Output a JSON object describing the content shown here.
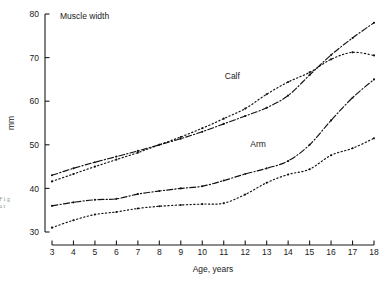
{
  "figure": {
    "title": "Muscle width",
    "ylabel": "mm",
    "xlabel": "Age, years",
    "series_labels": {
      "calf": "Calf",
      "arm": "Arm"
    },
    "margin_note": "F i g u r"
  },
  "chart_data": {
    "type": "line",
    "title": "Muscle width",
    "xlabel": "Age, years",
    "ylabel": "mm",
    "xlim": [
      3,
      18
    ],
    "ylim": [
      30,
      80
    ],
    "xticks": [
      3,
      4,
      5,
      6,
      7,
      8,
      9,
      10,
      11,
      12,
      13,
      14,
      15,
      16,
      17,
      18
    ],
    "yticks": [
      30,
      40,
      50,
      60,
      70,
      80
    ],
    "xtick_labels": [
      "3",
      "4",
      "5",
      "6",
      "7",
      "8",
      "9",
      "10",
      "11",
      "12",
      "13",
      "14",
      "15",
      "16",
      "17",
      "18"
    ],
    "ytick_labels": [
      "30",
      "40",
      "50",
      "60",
      "70",
      "80"
    ],
    "grid": false,
    "legend": "inline-annotations",
    "annotations": [
      {
        "text": "Calf",
        "x": 11.4,
        "y": 65.0
      },
      {
        "text": "Arm",
        "x": 12.6,
        "y": 49.5
      }
    ],
    "x": [
      3,
      4,
      5,
      6,
      7,
      8,
      9,
      10,
      11,
      12,
      13,
      14,
      15,
      16,
      17,
      18
    ],
    "series": [
      {
        "name": "Calf boys",
        "style": "dash-dot",
        "values": [
          43.0,
          44.6,
          46.0,
          47.3,
          48.6,
          50.0,
          51.4,
          53.0,
          54.8,
          56.6,
          58.5,
          61.3,
          66.0,
          70.6,
          74.5,
          78.0
        ]
      },
      {
        "name": "Calf girls",
        "style": "dotted",
        "values": [
          41.6,
          43.3,
          45.0,
          46.6,
          48.2,
          50.0,
          51.8,
          53.8,
          56.0,
          58.3,
          61.6,
          64.4,
          66.6,
          69.6,
          71.2,
          70.5
        ]
      },
      {
        "name": "Arm boys",
        "style": "dash-dot",
        "values": [
          36.0,
          36.8,
          37.4,
          37.6,
          38.7,
          39.4,
          40.0,
          40.5,
          41.8,
          43.3,
          44.6,
          46.3,
          50.0,
          55.6,
          60.8,
          65.0
        ]
      },
      {
        "name": "Arm girls",
        "style": "dotted",
        "values": [
          31.0,
          32.7,
          34.0,
          34.6,
          35.4,
          35.9,
          36.2,
          36.4,
          36.6,
          38.6,
          41.3,
          43.2,
          44.4,
          47.6,
          49.2,
          51.5
        ]
      }
    ]
  }
}
